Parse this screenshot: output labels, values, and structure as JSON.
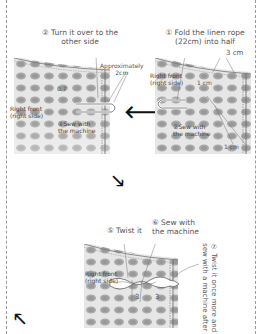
{
  "panels": {
    "left": {
      "step_label_line1": "② Turn it over to the",
      "step_label_line2": "other side",
      "approx_line1": "Approximately",
      "approx_line2": "2cm",
      "measure_07": "0.7",
      "fabric_label_line1": "Right front",
      "fabric_label_line2": "(right side)",
      "sew_line1": "④Sew with",
      "sew_line2": "the machine"
    },
    "right": {
      "step_label_line1": "① Fold the linen rope",
      "step_label_line2": "(22cm) into half",
      "measure_3cm": "3 cm",
      "fabric_label_line1": "Right front",
      "fabric_label_line2": "(right side)",
      "measure_1cm": "1 cm",
      "sew_line1": "②Sew with",
      "sew_line2": "the machine",
      "measure_bottom": "1 cm"
    },
    "bottom": {
      "twist_label": "⑤ Twist it",
      "sew_line1": "⑥ Sew with",
      "sew_line2": "the machine",
      "fabric_label_line1": "Right front",
      "fabric_label_line2": "(right side)",
      "measure_a": "3",
      "measure_b": "3",
      "vertical_line1": "⑦ Twist it once more and",
      "vertical_line2": "sew with a machine after"
    }
  },
  "arrows": {
    "left_arrow": "🡐",
    "down_right_arrow": "🡖",
    "up_left_arrow": "🡔"
  },
  "colors": {
    "fabric_base": "#e9e9e9",
    "fabric_spot": "#a9a9a9",
    "border_dash": "#9a9a9a",
    "arrow": "#111111"
  }
}
